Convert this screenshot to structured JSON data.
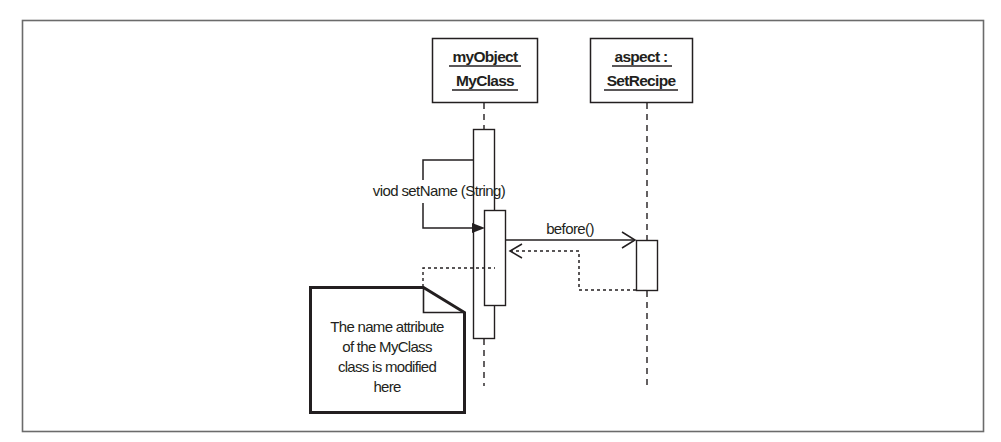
{
  "diagram": {
    "type": "UML sequence diagram",
    "lifelines": [
      {
        "id": "myObject",
        "line1": "myObject",
        "line2": "MyClass",
        "underlined": true
      },
      {
        "id": "aspect",
        "line1": "aspect :",
        "line2": "SetRecipe",
        "underlined": true
      }
    ],
    "messages": [
      {
        "id": "setName",
        "label": "viod setName (String)",
        "from": "myObject",
        "to": "myObject",
        "kind": "self-call",
        "arrow": "filled"
      },
      {
        "id": "before",
        "label": "before()",
        "from": "myObject",
        "to": "aspect",
        "kind": "synchronous",
        "arrow": "open"
      },
      {
        "id": "before-return",
        "label": "",
        "from": "aspect",
        "to": "myObject",
        "kind": "return",
        "arrow": "open",
        "style": "dashed"
      }
    ],
    "note": {
      "lines": [
        "The name attribute",
        "of the MyClass",
        "class is modified",
        "here"
      ],
      "attached_to": "myObject"
    },
    "colors": {
      "stroke": "#231f20",
      "frame": "#6b6b6b",
      "background": "#ffffff"
    }
  }
}
